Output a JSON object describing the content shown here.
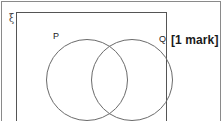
{
  "question": {
    "marks_label": "[1 mark]"
  },
  "diagram": {
    "type": "venn",
    "universal_set_symbol": "ξ",
    "sets": [
      {
        "id": "P",
        "label": "P"
      },
      {
        "id": "Q",
        "label": "Q"
      }
    ],
    "regions_shaded": [],
    "colors": {
      "page_background": "#ffffff",
      "outer_border": "#8a8a8a",
      "universal_box_border": "#555555",
      "circle_stroke": "#6b6b6b",
      "label_text": "#222222",
      "marks_text": "#1a1a1a"
    }
  }
}
